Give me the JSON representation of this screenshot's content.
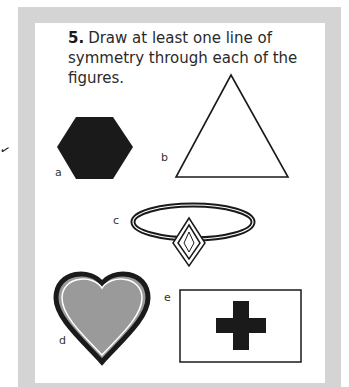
{
  "question": {
    "number": "5.",
    "text": "Draw at least one line of symmetry through each of the figures."
  },
  "figures": [
    {
      "label": "a",
      "shape": "hexagon",
      "fill": "#1a1a1a"
    },
    {
      "label": "b",
      "shape": "triangle",
      "fill": "#ffffff"
    },
    {
      "label": "c",
      "shape": "ring-with-diamond",
      "fill": "#ffffff"
    },
    {
      "label": "d",
      "shape": "heart",
      "fill": "#9a9a9a"
    },
    {
      "label": "e",
      "shape": "rectangle-with-cross",
      "fill": "#1a1a1a"
    }
  ],
  "colors": {
    "frame": "#d4d4d4",
    "panel": "#ffffff",
    "ink": "#1a1a1a"
  },
  "margin_mark": "✓"
}
